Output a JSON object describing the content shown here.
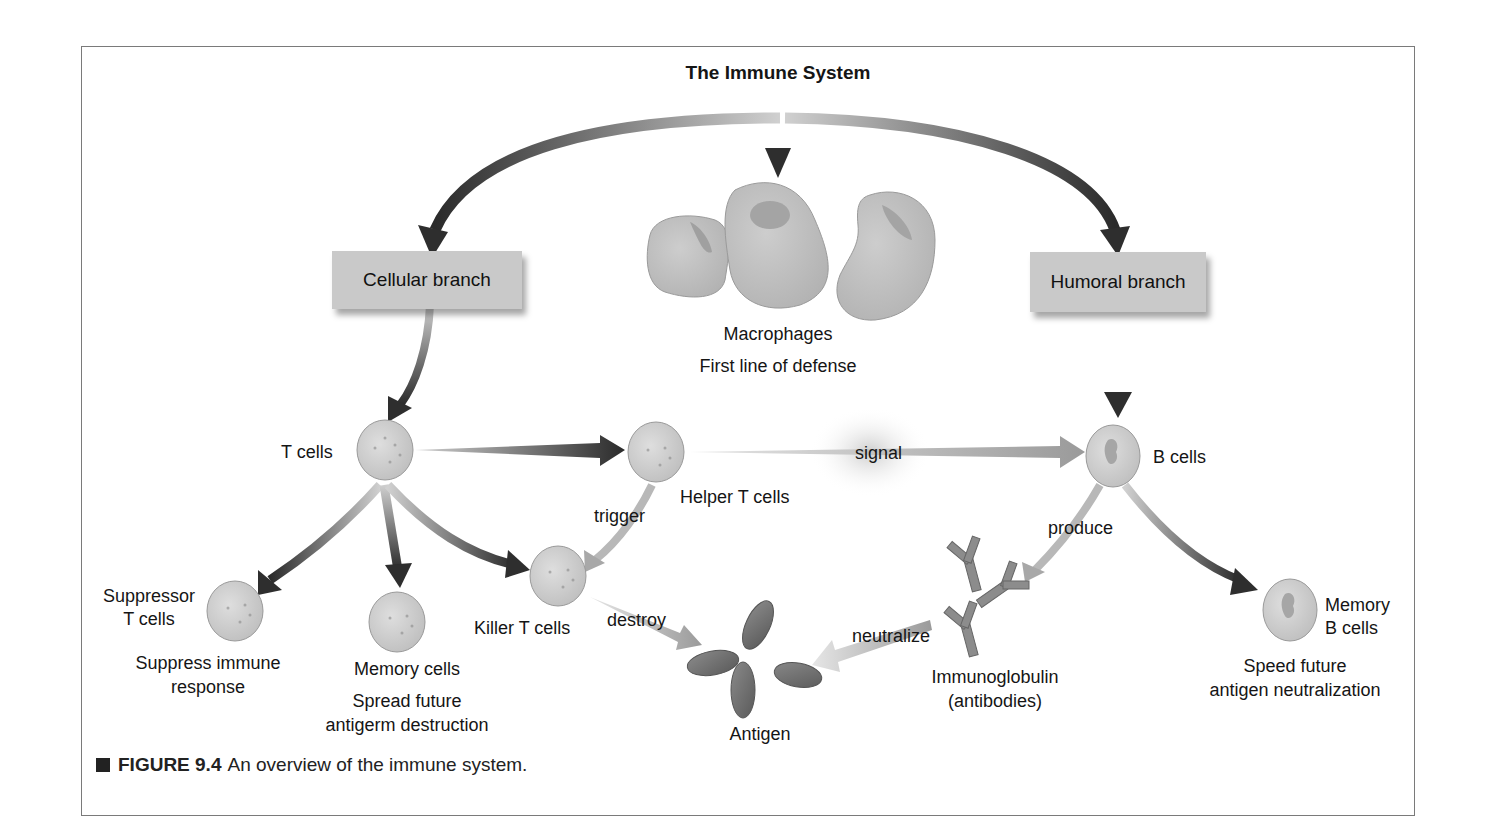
{
  "figure": {
    "title": "The Immune System",
    "branches": {
      "cellular": "Cellular branch",
      "humoral": "Humoral branch"
    },
    "macrophages": {
      "name": "Macrophages",
      "role": "First line of defense"
    },
    "cells": {
      "t_cells": "T cells",
      "helper_t": "Helper T cells",
      "b_cells": "B cells",
      "suppressor_t": [
        "Suppressor",
        "T cells"
      ],
      "suppressor_role": [
        "Suppress immune",
        "response"
      ],
      "memory_cells": "Memory cells",
      "memory_role": [
        "Spread future",
        "antigerm destruction"
      ],
      "killer_t": "Killer T cells",
      "memory_b": [
        "Memory",
        "B cells"
      ],
      "memory_b_role": [
        "Speed future",
        "antigen neutralization"
      ],
      "antigen": "Antigen",
      "immunoglobulin": [
        "Immunoglobulin",
        "(antibodies)"
      ]
    },
    "actions": {
      "signal": "signal",
      "trigger": "trigger",
      "destroy": "destroy",
      "produce": "produce",
      "neutralize": "neutralize"
    },
    "caption": {
      "label": "FIGURE 9.4",
      "text": "An overview of the immune system."
    }
  },
  "colors": {
    "border": "#7a7a7a",
    "box_fill": "#c9c9c9",
    "cell_fill": "#cfcfcf",
    "arrow_dark": "#2e2e2e",
    "arrow_light": "#a8a8a8"
  }
}
